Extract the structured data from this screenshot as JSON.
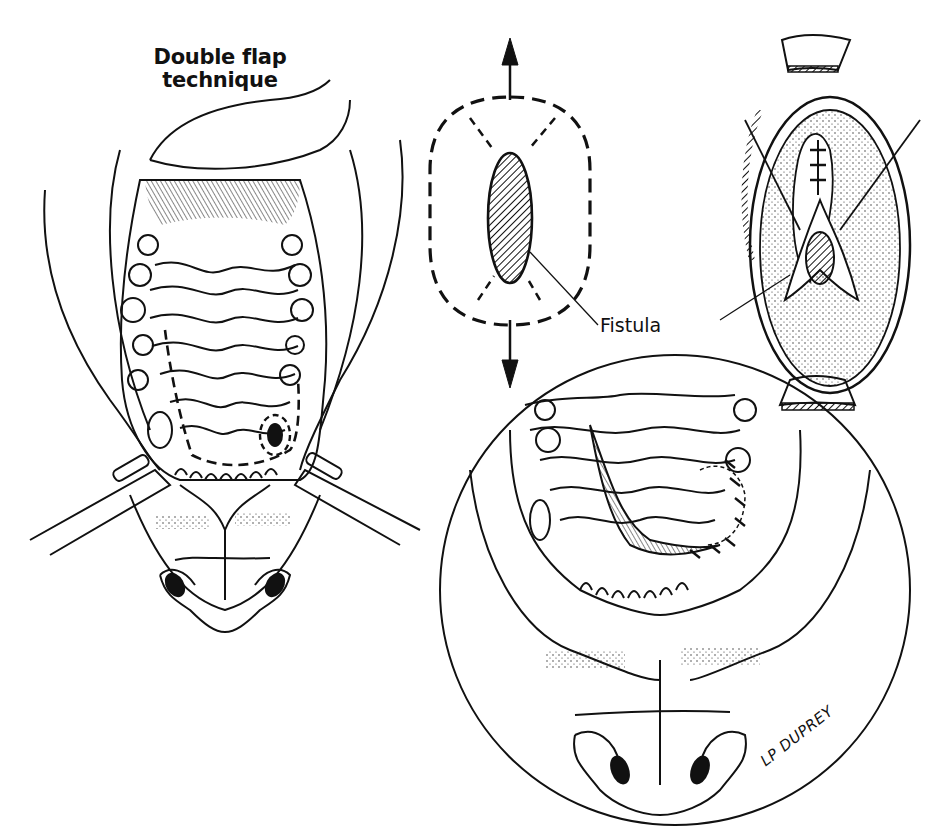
{
  "figure": {
    "title_lines": [
      "Double flap",
      "technique"
    ],
    "labels": {
      "fistula": "Fistula"
    },
    "signature": "LP DUPREY",
    "panels": [
      {
        "id": "overview",
        "description": "Ventral view of hard palate with dashed incision outline around fistula, retractors at mouth corners"
      },
      {
        "id": "schematic",
        "description": "Elliptical fistula (hatched) with dashed incision outline and tension arrows up and down"
      },
      {
        "id": "closure-detail",
        "description": "Oval inset showing flaps sutured over fistula with retracted tissue edges"
      },
      {
        "id": "result",
        "description": "Circular inset showing rotated flap sutured in place over fistula site"
      }
    ]
  },
  "colors": {
    "ink": "#111111",
    "paper": "#ffffff"
  }
}
